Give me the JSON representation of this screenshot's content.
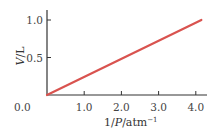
{
  "chart_data": {
    "type": "line",
    "title": "",
    "xlabel": "1/P/atm⁻¹",
    "xlabel_parts": {
      "num": "1/",
      "var": "P",
      "unit": "/atm",
      "sup": "−1"
    },
    "ylabel": "V/L",
    "ylabel_parts": {
      "var": "V",
      "unit": "/L"
    },
    "xlim": [
      0,
      4.3
    ],
    "ylim": [
      0,
      1.1
    ],
    "x_ticks": [
      0.0,
      1.0,
      2.0,
      3.0,
      4.0
    ],
    "x_tick_labels": [
      "0.0",
      "1.0",
      "2.0",
      "3.0",
      "4.0"
    ],
    "y_ticks": [
      0.5,
      1.0
    ],
    "y_tick_labels": [
      "0.5",
      "1.0"
    ],
    "grid": false,
    "legend": null,
    "series": [
      {
        "name": "V vs 1/P",
        "color": "#d9534f",
        "x": [
          0.0,
          4.15
        ],
        "y": [
          0.0,
          1.0
        ]
      }
    ]
  }
}
